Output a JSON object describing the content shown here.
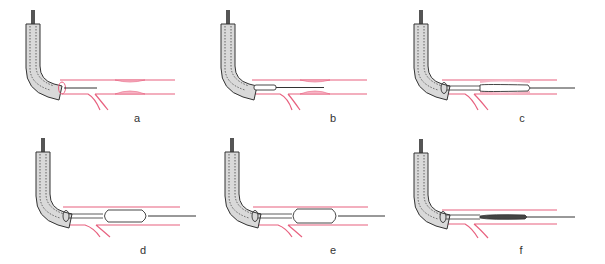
{
  "figure": {
    "colors": {
      "vessel": "#e8617f",
      "stricture_fill": "#f7b6c6",
      "scope_fill": "#d9d9d9",
      "scope_outline": "#333333",
      "wire": "#333333"
    },
    "panels": [
      {
        "id": "a",
        "label": "a",
        "stage": "scope at orifice, guidewire through stricture"
      },
      {
        "id": "b",
        "label": "b",
        "stage": "balloon catheter advanced out of scope"
      },
      {
        "id": "c",
        "label": "c",
        "stage": "deflated balloon positioned across stricture"
      },
      {
        "id": "d",
        "label": "d",
        "stage": "balloon inflated"
      },
      {
        "id": "e",
        "label": "e",
        "stage": "balloon fully inflated, stricture dilated"
      },
      {
        "id": "f",
        "label": "f",
        "stage": "balloon deflated after dilation"
      }
    ]
  }
}
